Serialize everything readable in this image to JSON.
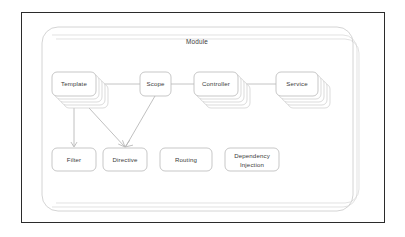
{
  "diagram": {
    "title": "Module",
    "type": "angularjs-architecture-diagram",
    "frame": {
      "border_color": "#2b2b2b"
    },
    "colors": {
      "box_stroke": "#b9b9b9",
      "box_fill": "#ffffff",
      "container_stroke": "#c9c9c9",
      "connector": "#b5b5b5",
      "arrow": "#b0b0b0",
      "text": "#3a3a3a",
      "background": "#ffffff"
    },
    "container": {
      "label": "Module",
      "stacked_copies": 3,
      "shape": "rounded-rectangle"
    },
    "nodes": [
      {
        "id": "template",
        "label": "Template",
        "row": "top",
        "stacked_copies": 4,
        "x": 52,
        "y": 72,
        "w": 44,
        "h": 24
      },
      {
        "id": "scope",
        "label": "Scope",
        "row": "top",
        "stacked_copies": 0,
        "x": 140,
        "y": 72,
        "w": 31,
        "h": 24
      },
      {
        "id": "controller",
        "label": "Controller",
        "row": "top",
        "stacked_copies": 4,
        "x": 194,
        "y": 72,
        "w": 44,
        "h": 24
      },
      {
        "id": "service",
        "label": "Service",
        "row": "top",
        "stacked_copies": 4,
        "x": 276,
        "y": 72,
        "w": 42,
        "h": 24
      },
      {
        "id": "filter",
        "label": "Filter",
        "row": "bottom",
        "stacked_copies": 0,
        "x": 52,
        "y": 148,
        "w": 44,
        "h": 23
      },
      {
        "id": "directive",
        "label": "Directive",
        "row": "bottom",
        "stacked_copies": 0,
        "x": 103,
        "y": 148,
        "w": 44,
        "h": 23
      },
      {
        "id": "routing",
        "label": "Routing",
        "row": "bottom",
        "stacked_copies": 0,
        "x": 160,
        "y": 148,
        "w": 52,
        "h": 23
      },
      {
        "id": "dependency-injection",
        "label": "Dependency Injection",
        "label_line_1": "Dependency",
        "label_line_2": "Injection",
        "row": "bottom",
        "stacked_copies": 0,
        "x": 225,
        "y": 148,
        "w": 54,
        "h": 23
      }
    ],
    "connections": [
      {
        "from": "template",
        "to": "scope",
        "style": "line",
        "arrow": false
      },
      {
        "from": "scope",
        "to": "controller",
        "style": "line",
        "arrow": false
      },
      {
        "from": "controller",
        "to": "service",
        "style": "line",
        "arrow": false
      },
      {
        "from": "template",
        "to": "filter",
        "style": "line",
        "arrow": true
      },
      {
        "from": "template",
        "to": "directive",
        "style": "line",
        "arrow": true
      },
      {
        "from": "scope",
        "to": "directive",
        "style": "line",
        "arrow": true
      }
    ]
  }
}
